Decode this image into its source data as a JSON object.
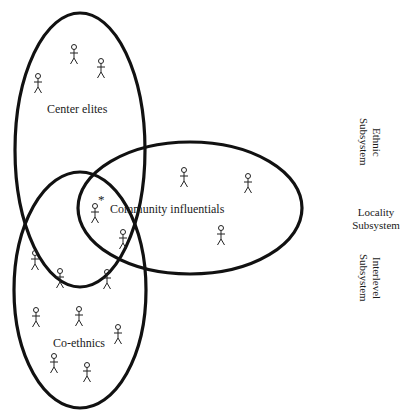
{
  "diagram": {
    "groups": [
      {
        "label": "Center elites"
      },
      {
        "label": "Community influentials"
      },
      {
        "label": "Co-ethnics"
      }
    ],
    "subsystems": [
      {
        "label_line1": "Ethnic",
        "label_line2": "Subsystem",
        "orientation": "vertical"
      },
      {
        "label_line1": "Locality",
        "label_line2": "Subsystem",
        "orientation": "horizontal"
      },
      {
        "label_line1": "Interlevel",
        "label_line2": "Subsystem",
        "orientation": "vertical"
      }
    ],
    "marker": "*",
    "person_icon_counts": {
      "center_elites": 3,
      "community_influentials": 4,
      "co_ethnics": 9
    },
    "stroke_color": "#111111"
  }
}
